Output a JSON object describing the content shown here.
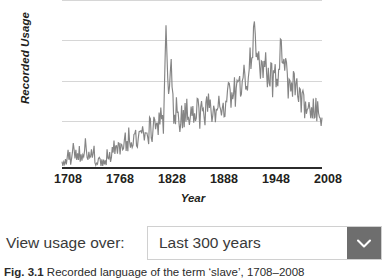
{
  "chart": {
    "y_axis_title": "Recorded Usage",
    "x_axis_title": "Year"
  },
  "control": {
    "label": "View usage over:",
    "selected_value": "Last 300 years",
    "chevron_icon": "chevron-down-icon"
  },
  "caption": {
    "figure_number": "Fig. 3.1",
    "text": "  Recorded language of the term ‘slave’, 1708–2008"
  },
  "colors": {
    "line": "#858585",
    "gridline": "#d6d6d6",
    "axis": "#2b2b2b",
    "select_button": "#6e6e6e",
    "select_border": "#d0d0d0",
    "text": "#3a3a3a"
  },
  "chart_data": {
    "type": "line",
    "title": "",
    "xlabel": "Year",
    "ylabel": "Recorded Usage",
    "xlim": [
      1708,
      2008
    ],
    "ylim": [
      0,
      1.0
    ],
    "xticks": [
      1708,
      1768,
      1828,
      1888,
      1948,
      2008
    ],
    "yticks": [],
    "grid": true,
    "gridline_values": [
      1.0,
      0.76,
      0.52,
      0.28
    ],
    "legend": "none",
    "series": [
      {
        "name": "Recorded Usage",
        "x": [
          1708,
          1711,
          1714,
          1717,
          1720,
          1723,
          1726,
          1729,
          1732,
          1735,
          1738,
          1741,
          1744,
          1747,
          1750,
          1753,
          1756,
          1759,
          1762,
          1765,
          1768,
          1771,
          1774,
          1777,
          1780,
          1783,
          1786,
          1789,
          1792,
          1795,
          1798,
          1801,
          1804,
          1807,
          1810,
          1813,
          1816,
          1819,
          1822,
          1825,
          1828,
          1831,
          1834,
          1837,
          1840,
          1843,
          1846,
          1849,
          1852,
          1855,
          1858,
          1861,
          1864,
          1867,
          1870,
          1873,
          1876,
          1879,
          1882,
          1885,
          1888,
          1891,
          1894,
          1897,
          1900,
          1903,
          1906,
          1909,
          1912,
          1915,
          1918,
          1921,
          1924,
          1927,
          1930,
          1933,
          1936,
          1939,
          1942,
          1945,
          1948,
          1951,
          1954,
          1957,
          1960,
          1963,
          1966,
          1969,
          1972,
          1975,
          1978,
          1981,
          1984,
          1987,
          1990,
          1993,
          1996,
          1999,
          2002,
          2005,
          2008
        ],
        "y": [
          0.055,
          0.05,
          0.085,
          0.06,
          0.11,
          0.07,
          0.055,
          0.09,
          0.065,
          0.12,
          0.075,
          0.06,
          0.1,
          0.055,
          0.07,
          0.05,
          0.045,
          0.055,
          0.07,
          0.09,
          0.13,
          0.11,
          0.155,
          0.12,
          0.17,
          0.14,
          0.19,
          0.16,
          0.215,
          0.175,
          0.3,
          0.2,
          0.23,
          0.185,
          0.26,
          0.205,
          0.31,
          0.225,
          0.34,
          0.25,
          0.76,
          0.38,
          0.6,
          0.3,
          0.355,
          0.27,
          0.31,
          0.285,
          0.4,
          0.32,
          0.395,
          0.33,
          0.37,
          0.3,
          0.345,
          0.325,
          0.4,
          0.33,
          0.37,
          0.34,
          0.355,
          0.33,
          0.38,
          0.345,
          0.43,
          0.4,
          0.455,
          0.42,
          0.49,
          0.455,
          0.52,
          0.56,
          0.6,
          0.64,
          0.91,
          0.62,
          0.66,
          0.57,
          0.61,
          0.545,
          0.58,
          0.52,
          0.56,
          0.5,
          0.77,
          0.545,
          0.575,
          0.515,
          0.545,
          0.48,
          0.5,
          0.45,
          0.42,
          0.38,
          0.345,
          0.4,
          0.33,
          0.375,
          0.32,
          0.35,
          0.3
        ]
      }
    ]
  }
}
